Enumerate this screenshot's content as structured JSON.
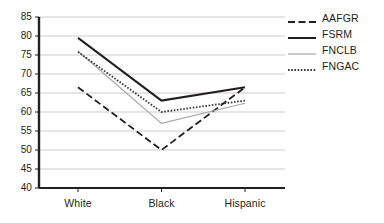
{
  "chart_data": {
    "type": "line",
    "title": "",
    "xlabel": "",
    "ylabel": "",
    "categories": [
      "White",
      "Black",
      "Hispanic"
    ],
    "ylim": [
      40,
      85
    ],
    "yticks": [
      40,
      45,
      50,
      55,
      60,
      65,
      70,
      75,
      80,
      85
    ],
    "grid": true,
    "legend_position": "right",
    "series": [
      {
        "name": "AAFGR",
        "values": [
          66.5,
          50.0,
          66.5
        ],
        "style": "dashed",
        "color": "#231f20",
        "width": 1.8
      },
      {
        "name": "FSRM",
        "values": [
          79.5,
          63.0,
          66.5
        ],
        "style": "solid",
        "color": "#231f20",
        "width": 2.0
      },
      {
        "name": "FNCLB",
        "values": [
          76.0,
          57.0,
          62.3
        ],
        "style": "solid-thin",
        "color": "#a6a6a6",
        "width": 1.2
      },
      {
        "name": "FNGAC",
        "values": [
          75.8,
          60.0,
          63.0
        ],
        "style": "dotted",
        "color": "#3a3a3a",
        "width": 1.8
      }
    ]
  },
  "axes": {
    "y_tick_labels": [
      "85",
      "80",
      "75",
      "70",
      "65",
      "60",
      "55",
      "50",
      "45",
      "40"
    ],
    "x_tick_labels": [
      "White",
      "Black",
      "Hispanic"
    ]
  },
  "legend": {
    "entries": [
      {
        "label": "AAFGR"
      },
      {
        "label": "FSRM"
      },
      {
        "label": "FNCLB"
      },
      {
        "label": "FNGAC"
      }
    ]
  },
  "colors": {
    "axis": "#231f20",
    "grid": "#bfbfbf",
    "series_dark": "#231f20",
    "series_light": "#a6a6a6"
  }
}
